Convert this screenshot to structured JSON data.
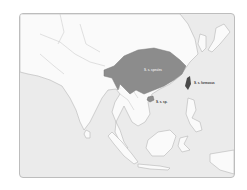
{
  "map": {
    "region": "South and Southeast Asia",
    "colors": {
      "sea": "#ebebeb",
      "land": "#fafafa",
      "border": "#b5b5b5",
      "range_main": "#8c8c8c",
      "range_taiwan": "#4a4a4a",
      "range_hainan": "#8c8c8c",
      "frame": "#bdbdbd"
    },
    "labels": {
      "main_range": "S. s. species",
      "taiwan": "S. s. formosus",
      "hainan": "S. s. sp."
    }
  }
}
